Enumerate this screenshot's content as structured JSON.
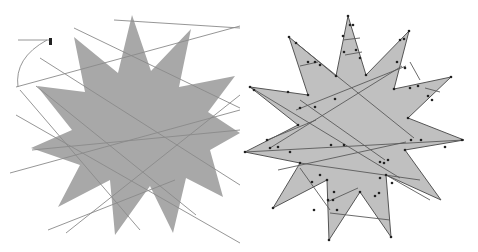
{
  "colors": {
    "background": "#ffffff",
    "left_fill": "#a8a8a8",
    "right_fill": "#c0c0c0",
    "right_stroke": "#555555",
    "line": "#8a8a8a",
    "clip_line": "#5a5a5a",
    "marker": "#222222"
  },
  "left_panel": {
    "label": "unclipped",
    "star_points": [
      [
        132,
        15
      ],
      [
        151,
        71
      ],
      [
        191,
        29
      ],
      [
        179,
        87
      ],
      [
        235,
        76
      ],
      [
        208,
        112
      ],
      [
        240,
        133
      ],
      [
        210,
        150
      ],
      [
        223,
        197
      ],
      [
        186,
        178
      ],
      [
        173,
        233
      ],
      [
        150,
        186
      ],
      [
        115,
        235
      ],
      [
        110,
        180
      ],
      [
        58,
        207
      ],
      [
        80,
        165
      ],
      [
        31,
        148
      ],
      [
        72,
        130
      ],
      [
        37,
        86
      ],
      [
        85,
        92
      ],
      [
        74,
        37
      ],
      [
        118,
        73
      ]
    ],
    "lines": [
      [
        [
          114,
          20
        ],
        [
          240,
          28
        ]
      ],
      [
        [
          74,
          28
        ],
        [
          240,
          108
        ]
      ],
      [
        [
          16,
          87
        ],
        [
          240,
          26
        ]
      ],
      [
        [
          40,
          58
        ],
        [
          240,
          185
        ]
      ],
      [
        [
          36,
          86
        ],
        [
          196,
          215
        ]
      ],
      [
        [
          16,
          115
        ],
        [
          240,
          243
        ]
      ],
      [
        [
          10,
          173
        ],
        [
          240,
          110
        ]
      ],
      [
        [
          32,
          150
        ],
        [
          240,
          130
        ]
      ],
      [
        [
          66,
          233
        ],
        [
          240,
          95
        ]
      ],
      [
        [
          48,
          230
        ],
        [
          175,
          180
        ]
      ],
      [
        [
          20,
          90
        ],
        [
          140,
          230
        ]
      ],
      [
        [
          18,
          40
        ],
        [
          50,
          40
        ]
      ]
    ],
    "curve": "M18 87 Q14 58 47 40"
  },
  "right_panel": {
    "label": "clipped",
    "star_points": [
      [
        348,
        16
      ],
      [
        366,
        75
      ],
      [
        409,
        31
      ],
      [
        394,
        89
      ],
      [
        451,
        77
      ],
      [
        408,
        118
      ],
      [
        464,
        140
      ],
      [
        405,
        150
      ],
      [
        441,
        200
      ],
      [
        386,
        175
      ],
      [
        391,
        237
      ],
      [
        360,
        192
      ],
      [
        329,
        240
      ],
      [
        327,
        180
      ],
      [
        273,
        208
      ],
      [
        300,
        163
      ],
      [
        245,
        152
      ],
      [
        298,
        125
      ],
      [
        250,
        87
      ],
      [
        308,
        95
      ],
      [
        289,
        37
      ],
      [
        336,
        76
      ]
    ],
    "clip_segments": [
      [
        [
          250,
          87
        ],
        [
          400,
          178
        ]
      ],
      [
        [
          296,
          43
        ],
        [
          414,
          138
        ]
      ],
      [
        [
          300,
          66
        ],
        [
          318,
          62
        ]
      ],
      [
        [
          343,
          40
        ],
        [
          360,
          38
        ]
      ],
      [
        [
          345,
          55
        ],
        [
          362,
          52
        ]
      ],
      [
        [
          296,
          110
        ],
        [
          406,
          66
        ]
      ],
      [
        [
          267,
          140
        ],
        [
          316,
          120
        ]
      ],
      [
        [
          270,
          148
        ],
        [
          402,
          66
        ]
      ],
      [
        [
          245,
          152
        ],
        [
          464,
          140
        ]
      ],
      [
        [
          278,
          170
        ],
        [
          406,
          142
        ]
      ],
      [
        [
          300,
          163
        ],
        [
          420,
          180
        ]
      ],
      [
        [
          300,
          168
        ],
        [
          330,
          210
        ]
      ],
      [
        [
          327,
          202
        ],
        [
          358,
          188
        ]
      ],
      [
        [
          330,
          213
        ],
        [
          390,
          220
        ]
      ],
      [
        [
          386,
          175
        ],
        [
          430,
          200
        ]
      ],
      [
        [
          300,
          100
        ],
        [
          385,
          160
        ]
      ],
      [
        [
          410,
          62
        ],
        [
          420,
          80
        ]
      ],
      [
        [
          425,
          88
        ],
        [
          440,
          92
        ]
      ]
    ],
    "markers": [
      [
        348,
        16
      ],
      [
        350,
        25
      ],
      [
        353,
        25
      ],
      [
        343,
        36
      ],
      [
        344,
        52
      ],
      [
        356,
        50
      ],
      [
        360,
        58
      ],
      [
        366,
        75
      ],
      [
        409,
        31
      ],
      [
        404,
        39
      ],
      [
        400,
        40
      ],
      [
        397,
        62
      ],
      [
        405,
        68
      ],
      [
        394,
        89
      ],
      [
        410,
        88
      ],
      [
        418,
        86
      ],
      [
        428,
        96
      ],
      [
        432,
        100
      ],
      [
        451,
        77
      ],
      [
        408,
        118
      ],
      [
        411,
        140
      ],
      [
        421,
        140
      ],
      [
        462,
        140
      ],
      [
        445,
        147
      ],
      [
        405,
        150
      ],
      [
        388,
        160
      ],
      [
        384,
        163
      ],
      [
        380,
        162
      ],
      [
        392,
        183
      ],
      [
        386,
        175
      ],
      [
        391,
        237
      ],
      [
        379,
        193
      ],
      [
        375,
        196
      ],
      [
        360,
        192
      ],
      [
        334,
        192
      ],
      [
        333,
        200
      ],
      [
        337,
        210
      ],
      [
        329,
        240
      ],
      [
        327,
        180
      ],
      [
        328,
        200
      ],
      [
        314,
        210
      ],
      [
        300,
        163
      ],
      [
        312,
        182
      ],
      [
        320,
        175
      ],
      [
        273,
        208
      ],
      [
        245,
        152
      ],
      [
        267,
        140
      ],
      [
        270,
        148
      ],
      [
        278,
        147
      ],
      [
        290,
        152
      ],
      [
        298,
        125
      ],
      [
        300,
        108
      ],
      [
        250,
        87
      ],
      [
        254,
        90
      ],
      [
        288,
        92
      ],
      [
        308,
        95
      ],
      [
        289,
        37
      ],
      [
        296,
        43
      ],
      [
        308,
        62
      ],
      [
        315,
        62
      ],
      [
        320,
        65
      ],
      [
        336,
        76
      ],
      [
        335,
        99
      ],
      [
        315,
        107
      ],
      [
        344,
        145
      ],
      [
        331,
        145
      ],
      [
        380,
        178
      ]
    ]
  }
}
